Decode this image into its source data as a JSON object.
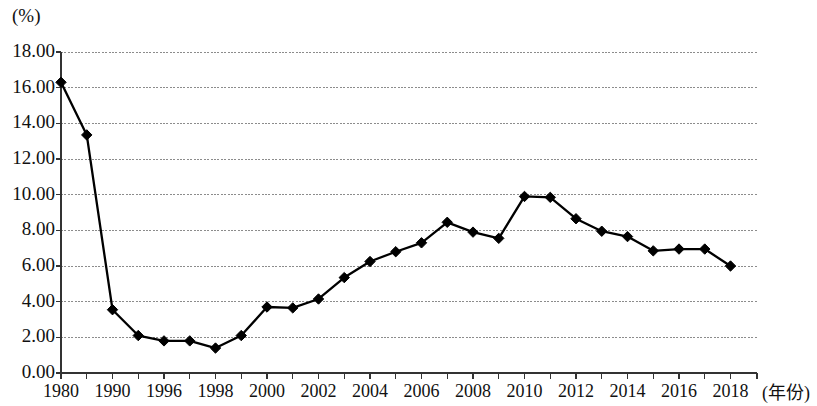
{
  "chart_data": {
    "type": "line",
    "title": "",
    "xlabel": "(年份)",
    "ylabel": "(%)",
    "ylim": [
      0,
      18
    ],
    "xlim": [
      1980,
      2018
    ],
    "grid": true,
    "legend": null,
    "marker": "diamond",
    "line_color": "#000000",
    "grid_color": "#8c8c8c",
    "axis_color": "#333333",
    "y_ticks": [
      "0.00",
      "2.00",
      "4.00",
      "6.00",
      "8.00",
      "10.00",
      "12.00",
      "14.00",
      "16.00",
      "18.00"
    ],
    "y_tick_values": [
      0,
      2,
      4,
      6,
      8,
      10,
      12,
      14,
      16,
      18
    ],
    "x_tick_labels": [
      "1980",
      "1990",
      "1996",
      "1998",
      "2000",
      "2002",
      "2004",
      "2006",
      "2008",
      "2010",
      "2012",
      "2014",
      "2016",
      "2018"
    ],
    "x_tick_label_years": [
      1980,
      1990,
      1996,
      1998,
      2000,
      2002,
      2004,
      2006,
      2008,
      2010,
      2012,
      2014,
      2016,
      2018
    ],
    "x_minor_ticks": [
      1985,
      1994,
      1997,
      1999,
      2001,
      2003,
      2005,
      2007,
      2009,
      2011,
      2013,
      2015,
      2017
    ],
    "x": [
      1980,
      1985,
      1990,
      1994,
      1996,
      1997,
      1998,
      1999,
      2000,
      2001,
      2002,
      2003,
      2004,
      2005,
      2006,
      2007,
      2008,
      2009,
      2010,
      2011,
      2012,
      2013,
      2014,
      2015,
      2016,
      2017,
      2018
    ],
    "values": [
      16.3,
      13.35,
      3.55,
      2.1,
      1.8,
      1.8,
      1.4,
      2.1,
      3.7,
      3.65,
      4.15,
      5.35,
      6.25,
      6.8,
      7.3,
      8.45,
      7.9,
      7.55,
      9.9,
      9.85,
      8.65,
      7.95,
      7.65,
      6.85,
      6.95,
      6.95,
      6.0
    ],
    "series": [
      {
        "name": "",
        "values": [
          16.3,
          13.35,
          3.55,
          2.1,
          1.8,
          1.8,
          1.4,
          2.1,
          3.7,
          3.65,
          4.15,
          5.35,
          6.25,
          6.8,
          7.3,
          8.45,
          7.9,
          7.55,
          9.9,
          9.85,
          8.65,
          7.95,
          7.65,
          6.85,
          6.95,
          6.95,
          6.0
        ]
      }
    ]
  }
}
